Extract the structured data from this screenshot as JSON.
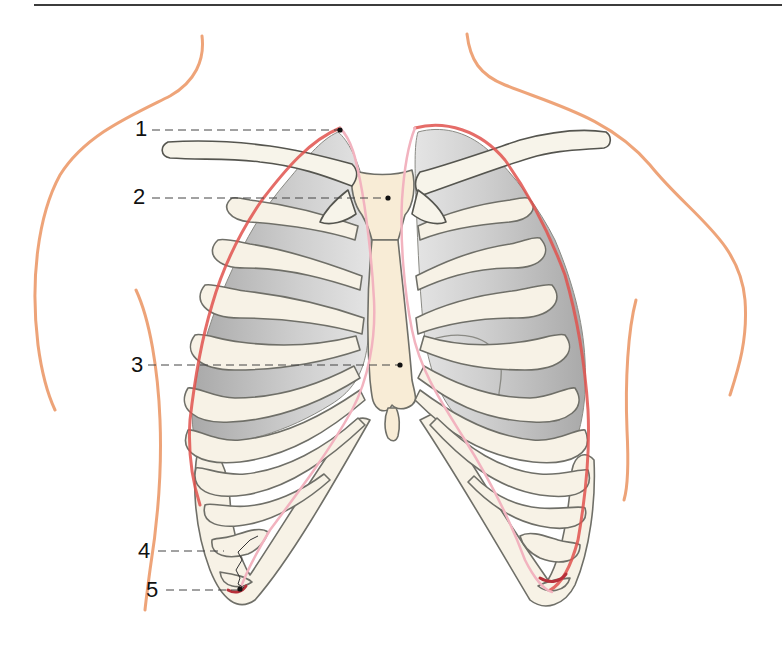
{
  "figure": {
    "labels": [
      {
        "id": "1",
        "text": "1",
        "target": "pleural apex (cupula)"
      },
      {
        "id": "2",
        "text": "2",
        "target": "sternal manubrium"
      },
      {
        "id": "3",
        "text": "3",
        "target": "sternal body"
      },
      {
        "id": "4",
        "text": "4",
        "target": "lower lung border"
      },
      {
        "id": "5",
        "text": "5",
        "target": "lower pleural border (costodiaphragmatic recess)"
      }
    ]
  },
  "colors": {
    "skin_outline": "#ec9a6a",
    "pleura": "#e0524e",
    "pleura_light": "#f2b3bf",
    "bone_fill": "#f7f2e6",
    "bone_outline": "#6f6f68",
    "lung": "#bdbdbd",
    "leader": "#444444"
  }
}
